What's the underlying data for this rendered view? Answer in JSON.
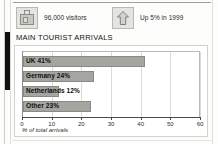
{
  "stats": [
    {
      "icon": "suitcase-icon",
      "label": "96,000 visitors"
    },
    {
      "icon": "up-arrow-icon",
      "label": "Up 5% in 1999"
    }
  ],
  "heading": "MAIN TOURIST ARRIVALS",
  "colors": {
    "bar_fill": "#a6a6a1",
    "bar_border": "#8a8a85",
    "icon_box": "#e4e4e0",
    "accent_bar": "#111111"
  },
  "chart_data": {
    "type": "bar",
    "orientation": "horizontal",
    "title": "MAIN TOURIST ARRIVALS",
    "categories": [
      "UK",
      "Germany",
      "Netherlands",
      "Other"
    ],
    "values": [
      41,
      24,
      12,
      23
    ],
    "bar_labels": [
      "UK 41%",
      "Germany 24%",
      "Netherlands 12%",
      "Other 23%"
    ],
    "xlabel": "% of total arrivals",
    "ylabel": "",
    "xlim": [
      0,
      60
    ],
    "xticks": [
      0,
      10,
      20,
      30,
      40,
      50,
      60
    ],
    "xtick_labels": [
      "0",
      "10",
      "20",
      "30",
      "40",
      "50",
      "60"
    ],
    "grid": true,
    "legend": false
  }
}
